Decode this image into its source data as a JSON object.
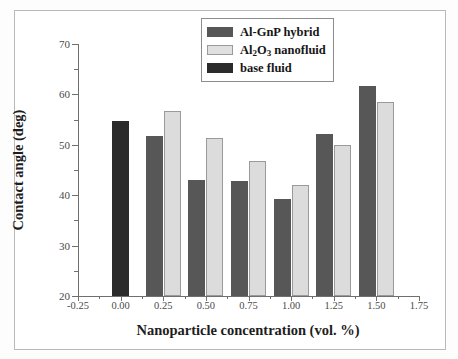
{
  "chart_data": {
    "type": "bar",
    "title": "",
    "xlabel": "Nanoparticle concentration (vol. %)",
    "ylabel": "Contact angle (deg)",
    "xlim": [
      -0.25,
      1.75
    ],
    "ylim": [
      20,
      70
    ],
    "xticks": [
      -0.25,
      0.0,
      0.25,
      0.5,
      0.75,
      1.0,
      1.25,
      1.5,
      1.75
    ],
    "xtick_labels": [
      "-0.25",
      "0.00",
      "0.25",
      "0.50",
      "0.75",
      "1.00",
      "1.25",
      "1.50",
      "1.75"
    ],
    "yticks": [
      20,
      30,
      40,
      50,
      60,
      70
    ],
    "ytick_labels": [
      "20",
      "30",
      "40",
      "50",
      "60",
      "70"
    ],
    "grid": false,
    "legend_position": "top-center",
    "categories": [
      0.0,
      0.25,
      0.5,
      0.75,
      1.0,
      1.25,
      1.5
    ],
    "series": [
      {
        "name": "Al-GnP hybrid",
        "color": "#575757",
        "x": [
          0.25,
          0.5,
          0.75,
          1.0,
          1.25,
          1.5
        ],
        "values": [
          51.8,
          43.0,
          42.8,
          39.2,
          52.1,
          61.7
        ]
      },
      {
        "name": "Al2O3 nanofluid",
        "color": "#e0e0e0",
        "x": [
          0.25,
          0.5,
          0.75,
          1.0,
          1.25,
          1.5
        ],
        "values": [
          56.7,
          51.3,
          46.7,
          42.1,
          50.0,
          58.4
        ]
      },
      {
        "name": "base fluid",
        "color": "#2b2b2b",
        "x": [
          0.0
        ],
        "values": [
          54.8
        ]
      }
    ]
  },
  "legend": {
    "items": [
      {
        "label": "Al-GnP hybrid",
        "swatch": "dark"
      },
      {
        "label_pre": "Al",
        "label_sub1": "2",
        "label_mid": "O",
        "label_sub2": "3",
        "label_post": " nanofluid",
        "swatch": "light"
      },
      {
        "label": "base fluid",
        "swatch": "black"
      }
    ]
  },
  "axes": {
    "y_title": "Contact angle (deg)",
    "x_title": "Nanoparticle concentration (vol. %)"
  }
}
